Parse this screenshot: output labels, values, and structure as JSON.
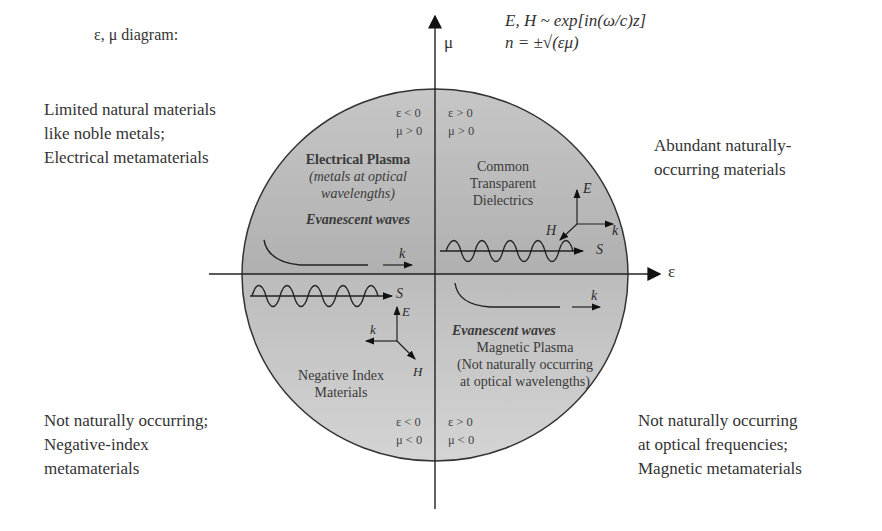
{
  "title": "ε, μ diagram:",
  "equations": {
    "line1": "E, H ~ exp[in(ω/c)z]",
    "line2": "n = ±√(εμ)"
  },
  "axes": {
    "x_label": "ε",
    "y_label": "μ"
  },
  "corner_notes": {
    "top_left": [
      "Limited natural materials",
      "like noble metals;",
      "Electrical metamaterials"
    ],
    "top_right": [
      "Abundant naturally-",
      "occurring materials"
    ],
    "bottom_left": [
      "Not naturally occurring;",
      "Negative-index",
      "metamaterials"
    ],
    "bottom_right": [
      "Not naturally occurring",
      "at optical frequencies;",
      "Magnetic metamaterials"
    ]
  },
  "quadrants": {
    "q2": {
      "signs": [
        "ε < 0",
        "μ > 0"
      ],
      "name": "Electrical Plasma",
      "subtitle_lines": [
        "(metals at optical",
        "wavelengths)"
      ],
      "wave_label": "Evanescent waves",
      "k_label": "k"
    },
    "q1": {
      "signs": [
        "ε > 0",
        "μ > 0"
      ],
      "name_lines": [
        "Common",
        "Transparent",
        "Dielectrics"
      ],
      "vectors": {
        "E": "E",
        "H": "H",
        "k": "k",
        "S": "S"
      }
    },
    "q3": {
      "signs": [
        "ε < 0",
        "μ < 0"
      ],
      "name_lines": [
        "Negative Index",
        "Materials"
      ],
      "vectors": {
        "E": "E",
        "H": "H",
        "k": "k",
        "S": "S"
      }
    },
    "q4": {
      "signs": [
        "ε > 0",
        "μ < 0"
      ],
      "wave_label": "Evanescent waves",
      "name": "Magnetic Plasma",
      "subtitle_lines": [
        "(Not naturally occurring",
        "at optical wavelengths)"
      ],
      "k_label": "k"
    }
  },
  "colors": {
    "circle_top": "#b8b8b8",
    "circle_bottom": "#c8c8c8",
    "line": "#222222"
  }
}
